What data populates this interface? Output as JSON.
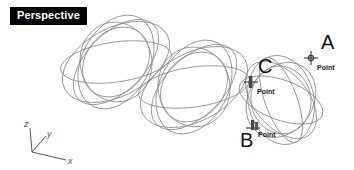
{
  "viewport": {
    "label": "Perspective",
    "background_color": "#ffffff",
    "curve_color": "#8a8a8a",
    "label_bg_color": "#000000",
    "label_text_color": "#ffffff"
  },
  "axis_gizmo": {
    "name": "world-axes-indicator",
    "axes": [
      {
        "id": "z",
        "label": "z"
      },
      {
        "id": "y",
        "label": "y"
      },
      {
        "id": "x",
        "label": "x"
      }
    ],
    "color": "#555555"
  },
  "annotations": [
    {
      "id": "a",
      "label": "A",
      "osnap": "Point",
      "label_x": 321,
      "label_y": 38,
      "marker_x": 303,
      "marker_y": 50,
      "text_x": 317,
      "text_y": 66
    },
    {
      "id": "c",
      "label": "C",
      "osnap": "Point",
      "label_x": 258,
      "label_y": 62,
      "marker_x": 243,
      "marker_y": 74,
      "text_x": 257,
      "text_y": 90
    },
    {
      "id": "b",
      "label": "B",
      "osnap": "Point",
      "label_x": 240,
      "label_y": 136,
      "marker_x": 245,
      "marker_y": 122,
      "text_x": 258,
      "text_y": 136
    }
  ],
  "geometry": {
    "description": "three ellipsoid wireframe clusters",
    "clusters": [
      {
        "id": "cluster-left",
        "cx": 116,
        "cy": 62,
        "rx": 58,
        "ry": 34,
        "tilt": -28
      },
      {
        "id": "cluster-middle",
        "cx": 194,
        "cy": 87,
        "rx": 58,
        "ry": 34,
        "tilt": -28
      },
      {
        "id": "cluster-right",
        "cx": 281,
        "cy": 100,
        "rx": 33,
        "ry": 45,
        "tilt": -12
      }
    ]
  }
}
